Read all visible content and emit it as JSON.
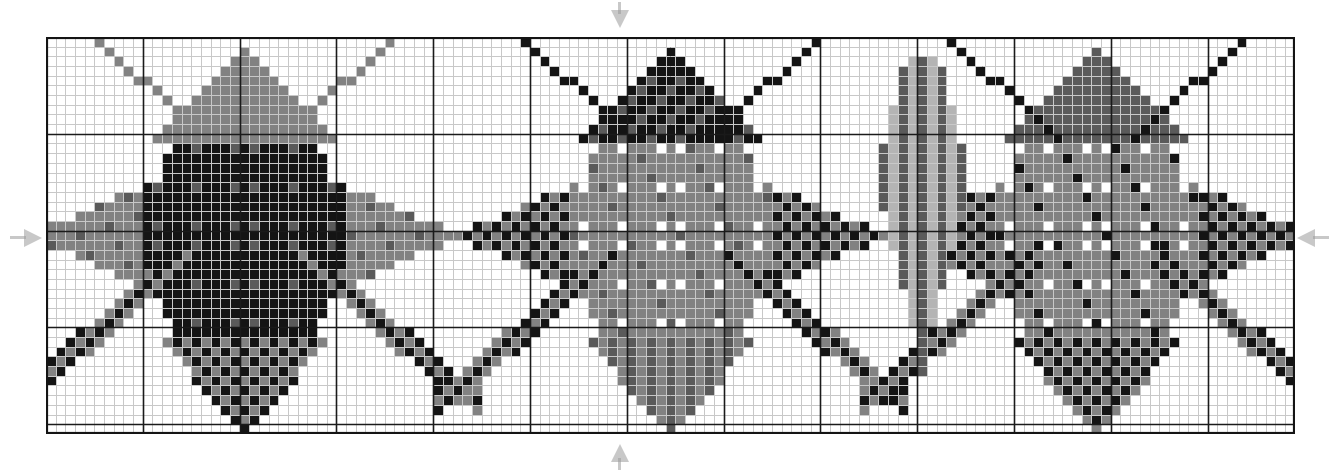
{
  "chart_data": {
    "type": "heatmap",
    "title": "",
    "subtitle": "",
    "xlabel": "",
    "ylabel": "",
    "grid": true,
    "legend_position": "none",
    "cols": 129,
    "rows": 41,
    "cell_px": 9.68,
    "heavy_every": 10,
    "origin_px": {
      "x": 46,
      "y": 37
    },
    "palette": {
      "white": "#ffffff",
      "light_gray": "#b4b4b4",
      "medium_gray": "#828282",
      "dark_gray": "#5a5a5a",
      "black": "#141414",
      "grid_light": "#c8c8c8",
      "grid_heavy": "#1a1a1a",
      "border": "#141414",
      "marker": "#9a9a9a"
    },
    "center_row": 20,
    "center_col": 64,
    "motifs": [
      {
        "name": "star-left",
        "center_col": 20,
        "center_row": 20,
        "style": "dense-dark",
        "core_color": "black",
        "arm_color": "medium_gray",
        "speckle_color": "dark_gray",
        "checker_color": "black"
      },
      {
        "name": "star-center",
        "center_col": 64,
        "center_row": 20,
        "style": "dotted-gray",
        "core_color": "medium_gray",
        "arm_color": "medium_gray",
        "speckle_color": "white",
        "checker_color": "black",
        "top_spike": "black-triangle",
        "bottom_spike": "vertical-stripes"
      },
      {
        "name": "star-right",
        "center_col": 108,
        "center_row": 20,
        "style": "mixed-checker",
        "core_color": "medium_gray",
        "arm_color": "light_gray",
        "speckle_color": "black",
        "checker_color": "black",
        "left_spike": "vertical-stripes"
      }
    ],
    "markers": [
      {
        "name": "center-marker-left",
        "side": "left",
        "at_row": 20
      },
      {
        "name": "center-marker-right",
        "side": "right",
        "at_row": 20
      },
      {
        "name": "center-marker-top",
        "side": "top",
        "at_col": 64
      },
      {
        "name": "center-marker-bottom",
        "side": "bottom",
        "at_col": 64
      }
    ]
  }
}
